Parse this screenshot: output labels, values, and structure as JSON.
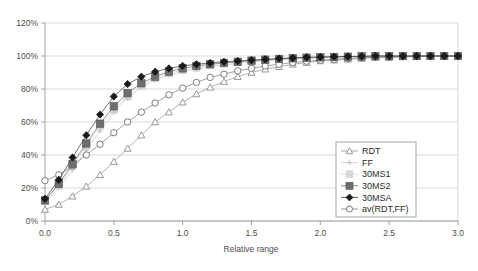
{
  "chart_data": {
    "type": "line",
    "title": "",
    "subtitle": "",
    "xlabel": "Relative range",
    "ylabel": "",
    "xlim": [
      0.0,
      3.0
    ],
    "ylim": [
      0.0,
      1.2
    ],
    "grid": true,
    "legend_position": "inside-bottom-right",
    "xticks": [
      0.0,
      0.5,
      1.0,
      1.5,
      2.0,
      2.5,
      3.0
    ],
    "xtick_labels": [
      "0.0",
      "0.5",
      "1.0",
      "1.5",
      "2.0",
      "2.5",
      "3.0"
    ],
    "yticks": [
      0.0,
      0.2,
      0.4,
      0.6,
      0.8,
      1.0,
      1.2
    ],
    "ytick_labels": [
      "0%",
      "20%",
      "40%",
      "60%",
      "80%",
      "100%",
      "120%"
    ],
    "x": [
      0.0,
      0.1,
      0.2,
      0.3,
      0.4,
      0.5,
      0.6,
      0.7,
      0.8,
      0.9,
      1.0,
      1.1,
      1.2,
      1.3,
      1.4,
      1.5,
      1.6,
      1.7,
      1.8,
      1.9,
      2.0,
      2.1,
      2.2,
      2.3,
      2.4,
      2.5,
      2.6,
      2.7,
      2.8,
      2.9,
      3.0
    ],
    "series": [
      {
        "name": "RDT",
        "marker": "triangle-open",
        "color": "#8c8c8c",
        "line_color": "#9e9e9e",
        "values": [
          0.07,
          0.1,
          0.15,
          0.21,
          0.28,
          0.36,
          0.44,
          0.52,
          0.6,
          0.66,
          0.72,
          0.77,
          0.81,
          0.845,
          0.875,
          0.9,
          0.92,
          0.935,
          0.95,
          0.96,
          0.97,
          0.975,
          0.98,
          0.985,
          0.99,
          0.99,
          0.995,
          0.995,
          1.0,
          1.0,
          1.0
        ]
      },
      {
        "name": "FF",
        "marker": "cross-small",
        "color": "#c9c9c9",
        "line_color": "#cfcfcf",
        "values": [
          0.11,
          0.2,
          0.31,
          0.43,
          0.545,
          0.66,
          0.745,
          0.81,
          0.855,
          0.885,
          0.905,
          0.92,
          0.935,
          0.945,
          0.955,
          0.965,
          0.97,
          0.975,
          0.98,
          0.985,
          0.99,
          0.99,
          0.995,
          0.995,
          1.0,
          1.0,
          1.0,
          1.0,
          1.0,
          1.0,
          1.0
        ]
      },
      {
        "name": "30MS1",
        "marker": "square-light",
        "color": "#d9d9d9",
        "line_color": "#dcdcdc",
        "values": [
          0.12,
          0.215,
          0.335,
          0.455,
          0.575,
          0.675,
          0.755,
          0.82,
          0.865,
          0.895,
          0.915,
          0.93,
          0.945,
          0.955,
          0.962,
          0.97,
          0.975,
          0.98,
          0.985,
          0.99,
          0.992,
          0.994,
          0.996,
          0.998,
          1.0,
          1.0,
          1.0,
          1.0,
          1.0,
          1.0,
          1.0
        ]
      },
      {
        "name": "30MS2",
        "marker": "square-dark",
        "color": "#6e6e6e",
        "line_color": "#7a7a7a",
        "values": [
          0.125,
          0.225,
          0.345,
          0.47,
          0.59,
          0.695,
          0.775,
          0.835,
          0.875,
          0.905,
          0.925,
          0.94,
          0.95,
          0.958,
          0.965,
          0.972,
          0.978,
          0.982,
          0.986,
          0.99,
          0.992,
          0.994,
          0.996,
          0.998,
          1.0,
          1.0,
          1.0,
          1.0,
          1.0,
          1.0,
          1.0
        ]
      },
      {
        "name": "30MSA",
        "marker": "diamond-filled",
        "color": "#1a1a1a",
        "line_color": "#4d4d4d",
        "values": [
          0.135,
          0.25,
          0.385,
          0.52,
          0.645,
          0.755,
          0.83,
          0.875,
          0.905,
          0.925,
          0.94,
          0.95,
          0.958,
          0.965,
          0.97,
          0.975,
          0.98,
          0.985,
          0.988,
          0.992,
          0.994,
          0.996,
          0.997,
          0.998,
          1.0,
          1.0,
          1.0,
          1.0,
          1.0,
          1.0,
          1.0
        ]
      },
      {
        "name": "av(RDT,FF)",
        "marker": "circle-open",
        "color": "#6e6e6e",
        "line_color": "#8a8a8a",
        "values": [
          0.245,
          0.28,
          0.335,
          0.4,
          0.465,
          0.535,
          0.6,
          0.66,
          0.715,
          0.765,
          0.805,
          0.84,
          0.87,
          0.89,
          0.91,
          0.925,
          0.94,
          0.95,
          0.96,
          0.968,
          0.975,
          0.98,
          0.985,
          0.99,
          0.992,
          0.994,
          0.996,
          0.998,
          1.0,
          1.0,
          1.0
        ]
      }
    ]
  },
  "legend": {
    "entries": [
      {
        "label": "RDT"
      },
      {
        "label": "FF"
      },
      {
        "label": "30MS1"
      },
      {
        "label": "30MS2"
      },
      {
        "label": "30MSA"
      },
      {
        "label": "av(RDT,FF)"
      }
    ]
  },
  "colors": {
    "background": "#ffffff",
    "gridline": "#c8c8c8",
    "axis": "#9a9a9a",
    "text": "#4d4d4d",
    "legend_border": "#8f8f8f"
  }
}
